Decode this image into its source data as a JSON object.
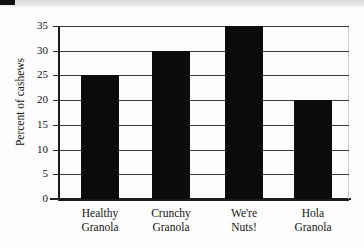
{
  "chart_data": {
    "type": "bar",
    "title": "",
    "subtitle": "",
    "xlabel": "",
    "ylabel": "Percent of cashews",
    "categories": [
      "Healthy Granola",
      "Crunchy Granola",
      "We're Nuts!",
      "Hola Granola"
    ],
    "category_lines": [
      [
        "Healthy",
        "Granola"
      ],
      [
        "Crunchy",
        "Granola"
      ],
      [
        "We're",
        "Nuts!"
      ],
      [
        "Hola",
        "Granola"
      ]
    ],
    "values": [
      25,
      30,
      35,
      20
    ],
    "ylim": [
      0,
      35
    ],
    "ytick_values": [
      0,
      5,
      10,
      15,
      20,
      25,
      30,
      35
    ],
    "ytick_labels": [
      "0",
      "5",
      "10",
      "15",
      "20",
      "25",
      "30",
      "35"
    ],
    "grid": "horizontal",
    "legend": "none",
    "bar_color": "#0c0c0c",
    "gridline_color": "#3b3b3b",
    "axis_color": "#1c1c1c",
    "background_color": "#fdfdfd"
  },
  "axis": {
    "y_title": "Percent of cashews",
    "ticks": [
      {
        "label": "35",
        "value": 35
      },
      {
        "label": "30",
        "value": 30
      },
      {
        "label": "25",
        "value": 25
      },
      {
        "label": "20",
        "value": 20
      },
      {
        "label": "15",
        "value": 15
      },
      {
        "label": "10",
        "value": 10
      },
      {
        "label": "5",
        "value": 5
      },
      {
        "label": "0",
        "value": 0
      }
    ]
  },
  "bars": [
    {
      "name": "Healthy Granola",
      "line1": "Healthy",
      "line2": "Granola",
      "value": 25
    },
    {
      "name": "Crunchy Granola",
      "line1": "Crunchy",
      "line2": "Granola",
      "value": 30
    },
    {
      "name": "We're Nuts!",
      "line1": "We're",
      "line2": "Nuts!",
      "value": 35
    },
    {
      "name": "Hola Granola",
      "line1": "Hola",
      "line2": "Granola",
      "value": 20
    }
  ]
}
